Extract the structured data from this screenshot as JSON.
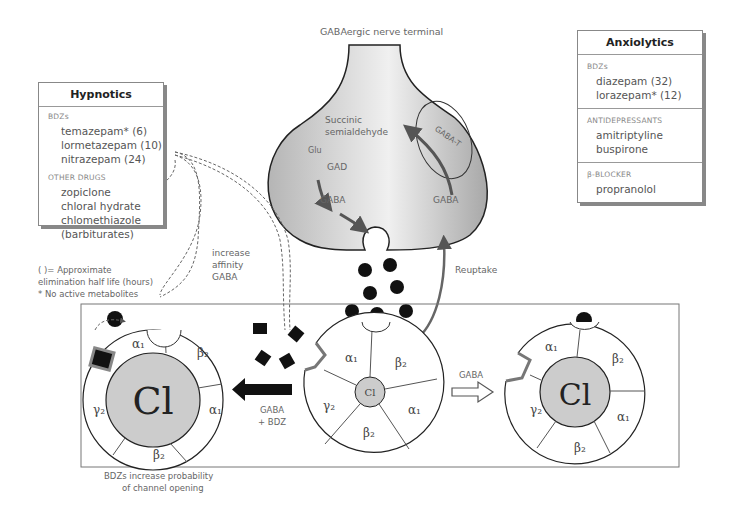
{
  "title": "GABAergic nerve terminal",
  "hypnotics": {
    "title": "Hypnotics",
    "sections": [
      {
        "category": "BDZs",
        "drugs": [
          "temazepam* (6)",
          "lormetazepam (10)",
          "nitrazepam (24)"
        ]
      },
      {
        "category": "OTHER DRUGS",
        "drugs": [
          "zopiclone",
          "chloral hydrate",
          "chlomethiazole",
          "(barbiturates)"
        ]
      }
    ]
  },
  "anxiolytics": {
    "title": "Anxiolytics",
    "sections": [
      {
        "category": "BDZs",
        "drugs": [
          "diazepam (32)",
          "lorazepam* (12)"
        ]
      },
      {
        "category": "ANTIDEPRESSANTS",
        "drugs": [
          "amitriptyline",
          "buspirone"
        ]
      },
      {
        "category": "β-BLOCKER",
        "drugs": [
          "propranolol"
        ]
      }
    ]
  },
  "footnotes": {
    "line1": "( )= Approximate",
    "line2": "elimination half life (hours)",
    "line3": "* No active metabolites"
  },
  "terminal": {
    "succinic1": "Succinic",
    "succinic2": "semialdehyde",
    "glu": "Glu",
    "gad": "GAD",
    "gaba_left": "GABA",
    "gaba_right": "GABA",
    "gaba_t": "GABA-T",
    "reuptake": "Reuptake"
  },
  "labels": {
    "increase1": "increase",
    "increase2": "affinity",
    "increase3": "GABA",
    "gaba_bdz1": "GABA",
    "gaba_bdz2": "+ BDZ",
    "gaba_arrow": "GABA",
    "caption1": "BDZs increase probability",
    "caption2": "of channel opening"
  },
  "receptor": {
    "ion": "Cl",
    "subunits": [
      "α1",
      "β2",
      "α1",
      "β2",
      "γ2"
    ]
  }
}
